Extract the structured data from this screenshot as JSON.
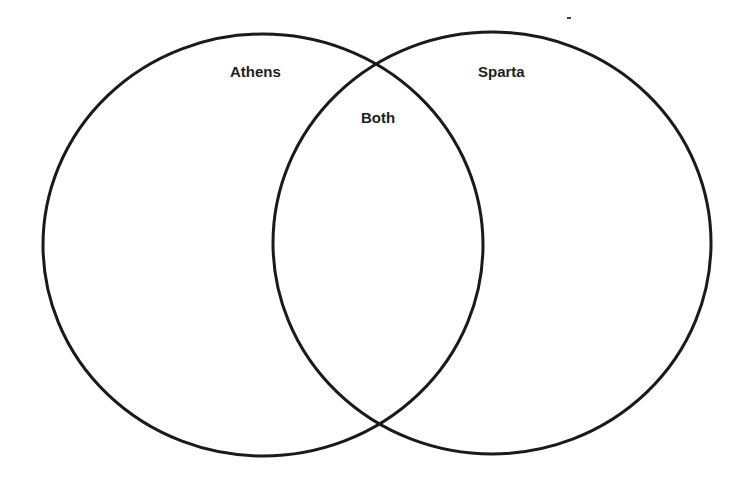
{
  "diagram": {
    "type": "venn",
    "stroke_color": "#1a1a1a",
    "background_color": "#ffffff",
    "sets": [
      {
        "id": "left",
        "label": "Athens",
        "cx": 263,
        "cy": 245,
        "rx": 220,
        "ry": 211
      },
      {
        "id": "right",
        "label": "Sparta",
        "cx": 492,
        "cy": 243,
        "rx": 219,
        "ry": 211
      }
    ],
    "intersection": {
      "label": "Both"
    }
  }
}
